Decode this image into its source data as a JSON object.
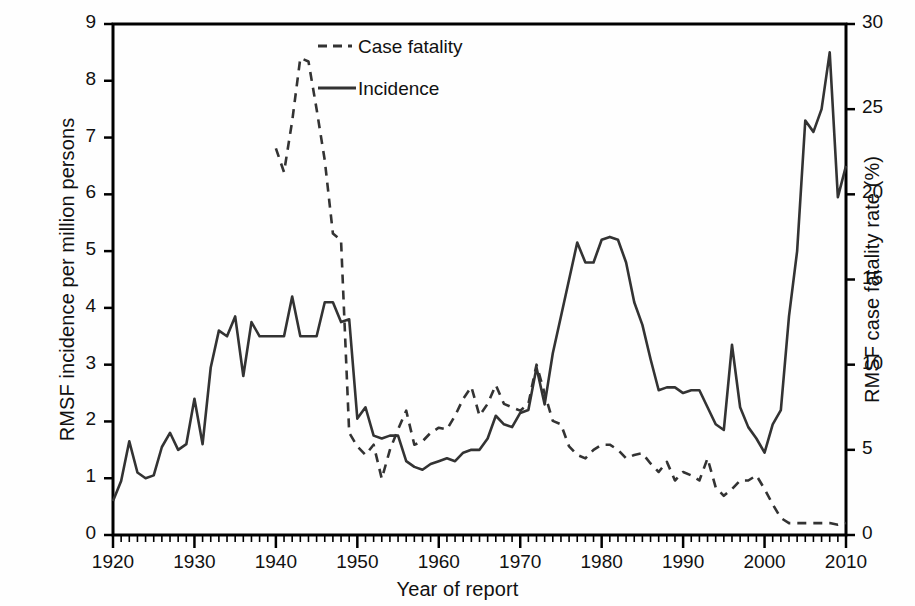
{
  "chart_data": {
    "type": "line",
    "title": "",
    "xlabel": "Year of report",
    "ylabel": "RMSF incidence per million persons",
    "ylabel_right": "RMSF case fatality rate (%)",
    "xlim": [
      1920,
      2010
    ],
    "ylim": [
      0,
      9
    ],
    "ylim_right": [
      0,
      30
    ],
    "xticks": [
      "1920",
      "1930",
      "1940",
      "1950",
      "1960",
      "1970",
      "1980",
      "1990",
      "2000",
      "2010"
    ],
    "yticks_left": [
      "0",
      "1",
      "2",
      "3",
      "4",
      "5",
      "6",
      "7",
      "8",
      "9"
    ],
    "yticks_right": [
      "0",
      "5",
      "10",
      "15",
      "20",
      "25",
      "30"
    ],
    "grid": false,
    "minor_ticks_x": "annual",
    "legend_position": "top-center",
    "legend": [
      {
        "name": "Case fatality",
        "style": "dashed",
        "axis": "right",
        "color": "#333333"
      },
      {
        "name": "Incidence",
        "style": "solid",
        "axis": "left",
        "color": "#333333"
      }
    ],
    "series": [
      {
        "name": "Incidence",
        "style": "solid",
        "axis": "left",
        "units": "cases per million persons",
        "x": [
          1920,
          1921,
          1922,
          1923,
          1924,
          1925,
          1926,
          1927,
          1928,
          1929,
          1930,
          1931,
          1932,
          1933,
          1934,
          1935,
          1936,
          1937,
          1938,
          1939,
          1940,
          1941,
          1942,
          1943,
          1944,
          1945,
          1946,
          1947,
          1948,
          1949,
          1950,
          1951,
          1952,
          1953,
          1954,
          1955,
          1956,
          1957,
          1958,
          1959,
          1960,
          1961,
          1962,
          1963,
          1964,
          1965,
          1966,
          1967,
          1968,
          1969,
          1970,
          1971,
          1972,
          1973,
          1974,
          1975,
          1976,
          1977,
          1978,
          1979,
          1980,
          1981,
          1982,
          1983,
          1984,
          1985,
          1986,
          1987,
          1988,
          1989,
          1990,
          1991,
          1992,
          1993,
          1994,
          1995,
          1996,
          1997,
          1998,
          1999,
          2000,
          2001,
          2002,
          2003,
          2004,
          2005,
          2006,
          2007,
          2008,
          2009,
          2010
        ],
        "y": [
          0.6,
          0.95,
          1.65,
          1.1,
          1.0,
          1.05,
          1.55,
          1.8,
          1.5,
          1.6,
          2.4,
          1.6,
          2.95,
          3.6,
          3.5,
          3.85,
          2.8,
          3.75,
          3.5,
          3.5,
          3.5,
          3.5,
          4.2,
          3.5,
          3.5,
          3.5,
          4.1,
          4.1,
          3.75,
          3.8,
          2.05,
          2.25,
          1.75,
          1.7,
          1.75,
          1.75,
          1.3,
          1.2,
          1.15,
          1.25,
          1.3,
          1.35,
          1.3,
          1.45,
          1.5,
          1.5,
          1.7,
          2.1,
          1.95,
          1.9,
          2.15,
          2.2,
          2.95,
          2.3,
          3.2,
          3.85,
          4.5,
          5.15,
          4.8,
          4.8,
          5.2,
          5.25,
          5.2,
          4.8,
          4.1,
          3.7,
          3.1,
          2.55,
          2.6,
          2.6,
          2.5,
          2.55,
          2.55,
          2.25,
          1.95,
          1.85,
          3.35,
          2.25,
          1.9,
          1.7,
          1.45,
          1.95,
          2.2,
          3.85,
          5.0,
          7.3,
          7.1,
          7.5,
          8.5,
          5.95,
          6.5
        ]
      },
      {
        "name": "Case fatality",
        "style": "dashed",
        "axis": "right",
        "units": "percent",
        "x": [
          1940,
          1941,
          1942,
          1943,
          1944,
          1945,
          1946,
          1947,
          1948,
          1949,
          1950,
          1951,
          1952,
          1953,
          1954,
          1955,
          1956,
          1957,
          1958,
          1959,
          1960,
          1961,
          1962,
          1963,
          1964,
          1965,
          1966,
          1967,
          1968,
          1969,
          1970,
          1971,
          1972,
          1973,
          1974,
          1975,
          1976,
          1977,
          1978,
          1979,
          1980,
          1981,
          1982,
          1983,
          1984,
          1985,
          1986,
          1987,
          1988,
          1989,
          1990,
          1991,
          1992,
          1993,
          1994,
          1995,
          1996,
          1997,
          1998,
          1999,
          2000,
          2001,
          2002,
          2003,
          2004,
          2005,
          2006,
          2007,
          2008,
          2009,
          2010
        ],
        "y_left_scale": [
          6.8,
          6.4,
          7.3,
          8.4,
          8.35,
          7.5,
          6.6,
          5.3,
          5.2,
          1.8,
          1.55,
          1.4,
          1.6,
          1.0,
          1.5,
          1.85,
          2.2,
          1.6,
          1.65,
          1.8,
          1.9,
          1.85,
          2.1,
          2.4,
          2.6,
          2.1,
          2.3,
          2.65,
          2.3,
          2.25,
          2.2,
          2.3,
          3.0,
          2.5,
          2.0,
          1.95,
          1.55,
          1.4,
          1.35,
          1.5,
          1.6,
          1.6,
          1.5,
          1.35,
          1.4,
          1.45,
          1.25,
          1.1,
          1.3,
          0.95,
          1.1,
          1.05,
          0.95,
          1.35,
          0.85,
          0.7,
          0.8,
          0.95,
          0.95,
          1.05,
          0.8,
          0.55,
          0.3,
          0.2,
          0.2,
          0.2,
          0.2,
          0.2,
          0.2,
          0.18,
          0.2
        ],
        "y": [
          22.7,
          21.3,
          24.3,
          28.0,
          27.8,
          25.0,
          22.0,
          17.7,
          17.3,
          6.0,
          5.2,
          4.7,
          5.3,
          3.3,
          5.0,
          6.2,
          7.3,
          5.3,
          5.5,
          6.0,
          6.3,
          6.2,
          7.0,
          8.0,
          8.7,
          7.0,
          7.7,
          8.8,
          7.7,
          7.5,
          7.3,
          7.7,
          10.0,
          8.3,
          6.7,
          6.5,
          5.2,
          4.7,
          4.5,
          5.0,
          5.3,
          5.3,
          5.0,
          4.5,
          4.7,
          4.8,
          4.2,
          3.7,
          4.3,
          3.2,
          3.7,
          3.5,
          3.2,
          4.5,
          2.8,
          2.3,
          2.7,
          3.2,
          3.2,
          3.5,
          2.7,
          1.8,
          1.0,
          0.7,
          0.7,
          0.7,
          0.7,
          0.7,
          0.7,
          0.6,
          0.7
        ]
      }
    ]
  },
  "axes": {
    "x_title": "Year of report",
    "y_left_title": "RMSF incidence per million persons",
    "y_right_title": "RMSF case fatality rate (%)"
  },
  "legend": {
    "case_fatality": "Case fatality",
    "incidence": "Incidence"
  },
  "colors": {
    "line": "#333333",
    "axis": "#000000",
    "background": "#fefefe"
  }
}
